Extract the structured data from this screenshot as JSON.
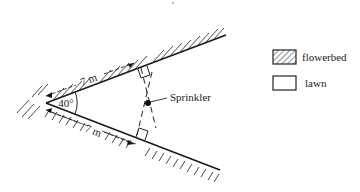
{
  "diagram": {
    "angle_label": "40°",
    "upper_length_label": "7 m",
    "lower_length_label": "7 m",
    "sprinkler_label": "Sprinkler"
  },
  "legend": {
    "items": [
      {
        "label": "flowerbed",
        "swatch": "hatched"
      },
      {
        "label": "lawn",
        "swatch": "plain"
      }
    ]
  },
  "colors": {
    "line": "#1a1a1a",
    "background": "#ffffff"
  }
}
